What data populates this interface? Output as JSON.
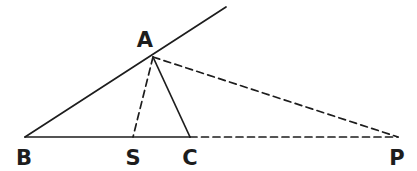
{
  "figure": {
    "background_color": "#ffffff",
    "stroke_color": "#1d1d1d",
    "label_color": "#1d1d1d",
    "width": 417,
    "height": 171
  },
  "points": {
    "A": {
      "label": "A",
      "x": 153,
      "y": 57,
      "label_x": 145,
      "label_y": 47
    },
    "B": {
      "label": "B",
      "x": 25,
      "y": 137,
      "label_x": 24,
      "label_y": 165
    },
    "S": {
      "label": "S",
      "x": 133,
      "y": 137,
      "label_x": 133,
      "label_y": 165
    },
    "C": {
      "label": "C",
      "x": 190,
      "y": 137,
      "label_x": 190,
      "label_y": 165
    },
    "P": {
      "label": "P",
      "x": 398,
      "y": 137,
      "label_x": 397,
      "label_y": 165
    },
    "RayEnd": {
      "label": "",
      "x": 226,
      "y": 7,
      "label_x": 0,
      "label_y": 0
    }
  },
  "segments": [
    {
      "name": "segment-b-to-rayend",
      "from": "B",
      "to": "RayEnd",
      "style": "solid",
      "stroke_width": 1.7
    },
    {
      "name": "segment-b-to-c",
      "from": "B",
      "to": "C",
      "style": "solid",
      "stroke_width": 1.7
    },
    {
      "name": "segment-a-to-c",
      "from": "A",
      "to": "C",
      "style": "solid",
      "stroke_width": 1.7
    },
    {
      "name": "segment-a-to-s",
      "from": "A",
      "to": "S",
      "style": "dashed",
      "stroke_width": 1.7
    },
    {
      "name": "segment-a-to-p",
      "from": "A",
      "to": "P",
      "style": "dashed",
      "stroke_width": 1.7
    },
    {
      "name": "segment-c-to-p",
      "from": "C",
      "to": "P",
      "style": "dashed",
      "stroke_width": 1.7
    }
  ],
  "dash_pattern": "7,4.5",
  "labels_order": [
    "A",
    "B",
    "S",
    "C",
    "P"
  ]
}
